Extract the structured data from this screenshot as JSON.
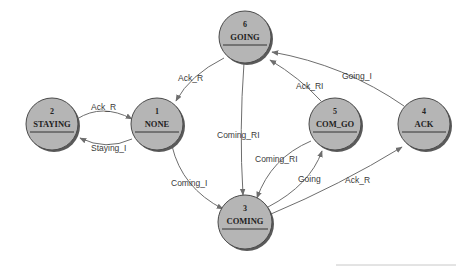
{
  "diagram": {
    "nodes": [
      {
        "id": "6",
        "name": "GOING",
        "cx": 245,
        "cy": 37,
        "r": 26
      },
      {
        "id": "2",
        "name": "STAYING",
        "cx": 52,
        "cy": 124,
        "r": 26
      },
      {
        "id": "1",
        "name": "NONE",
        "cx": 157,
        "cy": 124,
        "r": 26
      },
      {
        "id": "5",
        "name": "COM_GO",
        "cx": 335,
        "cy": 124,
        "r": 26
      },
      {
        "id": "4",
        "name": "ACK",
        "cx": 424,
        "cy": 124,
        "r": 26
      },
      {
        "id": "3",
        "name": "COMING",
        "cx": 245,
        "cy": 222,
        "r": 27
      }
    ],
    "edges": [
      {
        "from": "6",
        "to": "1",
        "label": "Ack_R"
      },
      {
        "from": "2",
        "to": "1",
        "label": "Ack_R"
      },
      {
        "from": "1",
        "to": "2",
        "label": "Staying_I"
      },
      {
        "from": "1",
        "to": "3",
        "label": "Coming_I"
      },
      {
        "from": "6",
        "to": "3",
        "label": "Coming_RI"
      },
      {
        "from": "5",
        "to": "3",
        "label": "Coming_RI"
      },
      {
        "from": "3",
        "to": "5",
        "label": "Going"
      },
      {
        "from": "3",
        "to": "4",
        "label": "Ack_R"
      },
      {
        "from": "5",
        "to": "6",
        "label": "Ack_RI"
      },
      {
        "from": "4",
        "to": "6",
        "label": "Going_I"
      }
    ]
  },
  "colors": {
    "node_fill": "#b5b5b5",
    "node_stroke": "#4a4a4a",
    "edge": "#6e6e6e",
    "background": "#ffffff"
  }
}
